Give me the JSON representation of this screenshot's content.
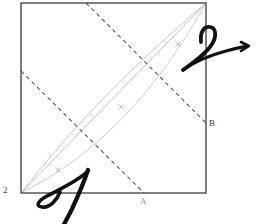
{
  "figure": {
    "kind": "geometry-diagram",
    "background": "#ffffff",
    "square": {
      "name": "outer-square",
      "x": 21,
      "y": 3,
      "width": 185,
      "height": 190,
      "stroke": "#3c3c3c",
      "stroke_width": 1.3
    },
    "curves": [
      {
        "name": "diagonal-straight-line",
        "from": [
          21,
          193
        ],
        "to": [
          206,
          3
        ],
        "stroke": "#b9b9b9",
        "stroke_width": 0.9,
        "style": "solid"
      },
      {
        "name": "arc-curve-lower",
        "from": [
          21,
          193
        ],
        "control": [
          96,
          96
        ],
        "to": [
          206,
          3
        ],
        "stroke": "#c0c0c0",
        "stroke_width": 0.9,
        "style": "solid"
      },
      {
        "name": "arc-curve-upper",
        "from": [
          21,
          193
        ],
        "control": [
          130,
          140
        ],
        "to": [
          206,
          3
        ],
        "stroke": "#c6c6c6",
        "stroke_width": 0.9,
        "style": "solid"
      }
    ],
    "dashed_lines": [
      {
        "name": "dashed-line-upper",
        "from": [
          86,
          3
        ],
        "to": [
          206,
          123
        ],
        "stroke": "#565656",
        "stroke_width": 1.1,
        "dash": "4 3.5",
        "endpoint_label": "B"
      },
      {
        "name": "dashed-line-lower",
        "from": [
          21,
          71
        ],
        "to": [
          144,
          193
        ],
        "stroke": "#565656",
        "stroke_width": 1.1,
        "dash": "4 3.5",
        "endpoint_label": "A"
      }
    ],
    "intersections": [
      {
        "name": "intersection-upper",
        "x": 144,
        "y": 68
      },
      {
        "name": "intersection-lower",
        "x": 81,
        "y": 131
      }
    ],
    "tick_marks": [
      {
        "name": "tick-mark-1",
        "x": 58,
        "y": 170,
        "angle": -46,
        "length": 7,
        "stroke": "#bdbdbd"
      },
      {
        "name": "tick-mark-2",
        "x": 121,
        "y": 107,
        "angle": -46,
        "length": 7,
        "stroke": "#bdbdbd"
      },
      {
        "name": "tick-mark-3",
        "x": 178,
        "y": 44,
        "angle": -46,
        "length": 7,
        "stroke": "#bdbdbd"
      }
    ],
    "labels": [
      {
        "name": "label-2",
        "text": "2",
        "x": 3,
        "y": 186,
        "color": "#3a3a3a"
      },
      {
        "name": "label-A",
        "text": "A",
        "x": 140,
        "y": 197,
        "color": "#8a8a8a"
      },
      {
        "name": "label-B",
        "text": "B",
        "x": 209,
        "y": 119,
        "color": "#3a3a3a"
      }
    ],
    "annotations": [
      {
        "name": "handwritten-mark-A",
        "glyph": "A",
        "stroke": "#111111",
        "stroke_width": 4,
        "location": "bottom-left-outside",
        "description": "thick handwritten letter A with loop crossing the bottom edge"
      },
      {
        "name": "handwritten-mark-2-with-arrow",
        "glyph": "2",
        "stroke": "#111111",
        "stroke_width": 4,
        "location": "top-right-outside",
        "description": "thick handwritten digit 2 with a long arrow pointing right"
      }
    ]
  }
}
